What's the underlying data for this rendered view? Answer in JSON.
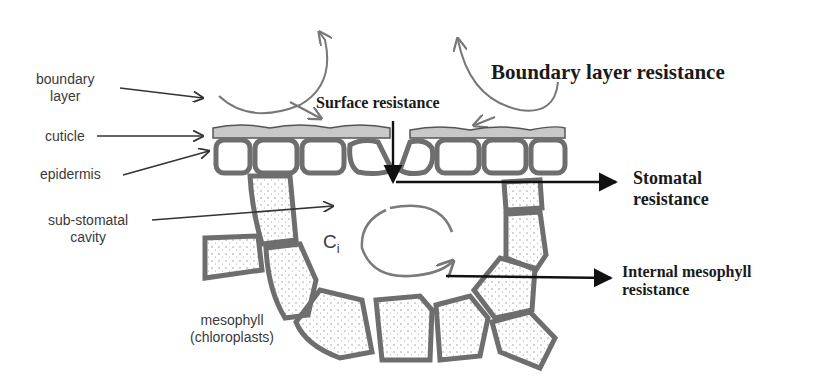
{
  "diagram": {
    "structure_labels": {
      "boundary_layer": [
        "boundary",
        "layer"
      ],
      "cuticle": "cuticle",
      "epidermis": "epidermis",
      "sub_stomatal_cavity": [
        "sub-stomatal",
        "cavity"
      ],
      "mesophyll": [
        "mesophyll",
        "(chloroplasts)"
      ]
    },
    "resistance_labels": {
      "boundary_layer_resistance": "Boundary layer resistance",
      "surface_resistance": "Surface resistance",
      "stomatal_resistance": [
        "Stomatal",
        "resistance"
      ],
      "internal_mesophyll_resistance": [
        "Internal mesophyll",
        "resistance"
      ]
    },
    "internal_concentration": {
      "symbol": "C",
      "subscript": "i"
    },
    "colors": {
      "cell_wall": "#6e6e6e",
      "cuticle": "#c8c8c8",
      "label_text": "#3a3a3a",
      "bold_text": "#1a1a1a",
      "arrow": "#222222",
      "flow_arrow": "#777777"
    }
  }
}
